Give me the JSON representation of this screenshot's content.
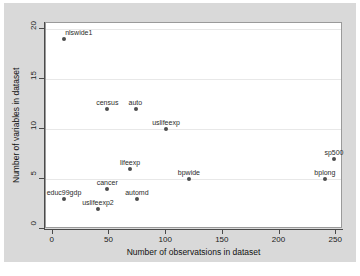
{
  "chart_data": {
    "type": "scatter",
    "title": "",
    "xlabel": "Number of observatsions in dataset",
    "ylabel": "Number of variables in dataset",
    "xlim": [
      -6,
      256
    ],
    "ylim": [
      0,
      20.6
    ],
    "xticks": [
      0,
      50,
      100,
      150,
      200,
      250
    ],
    "yticks": [
      0,
      5,
      10,
      15,
      20
    ],
    "grid": "horizontal",
    "legend": "none",
    "points": [
      {
        "label": "nlswide1",
        "x": 10,
        "y": 19,
        "label_pos": "top-right"
      },
      {
        "label": "census",
        "x": 48,
        "y": 12,
        "label_pos": "top"
      },
      {
        "label": "auto",
        "x": 73,
        "y": 12,
        "label_pos": "top"
      },
      {
        "label": "uslifeexp",
        "x": 100,
        "y": 10,
        "label_pos": "top"
      },
      {
        "label": "sp500",
        "x": 248,
        "y": 7,
        "label_pos": "top"
      },
      {
        "label": "lifeexp",
        "x": 68,
        "y": 6,
        "label_pos": "top"
      },
      {
        "label": "bpwide",
        "x": 120,
        "y": 5,
        "label_pos": "top"
      },
      {
        "label": "bplong",
        "x": 240,
        "y": 5,
        "label_pos": "top"
      },
      {
        "label": "cancer",
        "x": 48,
        "y": 4,
        "label_pos": "top"
      },
      {
        "label": "educ99gdp",
        "x": 10,
        "y": 3,
        "label_pos": "top"
      },
      {
        "label": "automd",
        "x": 74,
        "y": 3,
        "label_pos": "top"
      },
      {
        "label": "uslifeexp2",
        "x": 40,
        "y": 2,
        "label_pos": "top"
      }
    ],
    "colors": {
      "marker": "#4d4d4d",
      "plot_background": "#ffffff",
      "figure_background": "#d9d9d9",
      "gridline": "#e8e8e8",
      "axis": "#4a4a4a",
      "text": "#1a1a1a"
    }
  },
  "axes": {
    "x_tick_labels": [
      "0",
      "50",
      "100",
      "150",
      "200",
      "250"
    ],
    "y_tick_labels": [
      "0",
      "5",
      "10",
      "15",
      "20"
    ],
    "x_title": "Number of observatsions in dataset",
    "y_title": "Number of variables in dataset"
  }
}
